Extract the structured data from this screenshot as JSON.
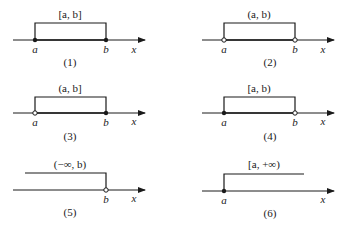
{
  "figure": {
    "axis_label": "x",
    "panels": [
      {
        "number": "(1)",
        "interval": "[a, b]",
        "left_label": "a",
        "right_label": "b",
        "left_closed": true,
        "right_closed": true
      },
      {
        "number": "(2)",
        "interval": "(a, b)",
        "left_label": "a",
        "right_label": "b",
        "left_closed": false,
        "right_closed": false
      },
      {
        "number": "(3)",
        "interval": "(a, b]",
        "left_label": "a",
        "right_label": "b",
        "left_closed": false,
        "right_closed": true
      },
      {
        "number": "(4)",
        "interval": "[a, b)",
        "left_label": "a",
        "right_label": "b",
        "left_closed": true,
        "right_closed": false
      },
      {
        "number": "(5)",
        "interval": "(−∞, b)",
        "left_label": "",
        "right_label": "b",
        "left_closed": null,
        "right_closed": false
      },
      {
        "number": "(6)",
        "interval": "[a, +∞)",
        "left_label": "a",
        "right_label": "",
        "left_closed": true,
        "right_closed": null
      }
    ]
  },
  "colors": {
    "line": "#1a1a1a",
    "background": "#ffffff"
  }
}
